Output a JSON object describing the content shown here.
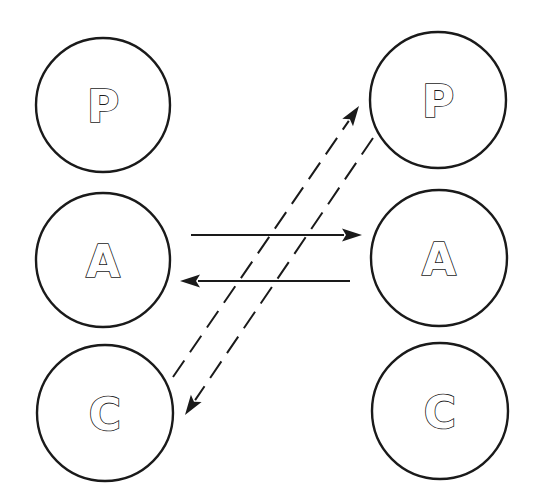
{
  "diagram": {
    "type": "transactional-analysis-ego-state-diagram",
    "colors": {
      "stroke": "#1a1a1a",
      "background": "#ffffff"
    },
    "left_person": {
      "nodes": [
        {
          "id": "L-P",
          "label": "P",
          "cx": 103,
          "cy": 105,
          "r": 67
        },
        {
          "id": "L-A",
          "label": "A",
          "cx": 103,
          "cy": 260,
          "r": 67
        },
        {
          "id": "L-C",
          "label": "C",
          "cx": 105,
          "cy": 413,
          "r": 68
        }
      ]
    },
    "right_person": {
      "nodes": [
        {
          "id": "R-P",
          "label": "P",
          "cx": 438,
          "cy": 100,
          "r": 68
        },
        {
          "id": "R-A",
          "label": "A",
          "cx": 439,
          "cy": 258,
          "r": 68
        },
        {
          "id": "R-C",
          "label": "C",
          "cx": 440,
          "cy": 411,
          "r": 68
        }
      ]
    },
    "arrows": [
      {
        "id": "adult-to-adult",
        "from": "L-A",
        "to": "R-A",
        "style": "solid",
        "x1": 191,
        "y1": 235,
        "x2": 362,
        "y2": 235
      },
      {
        "id": "adult-to-adult-return",
        "from": "R-A",
        "to": "L-A",
        "style": "solid",
        "x1": 350,
        "y1": 281,
        "x2": 180,
        "y2": 281
      },
      {
        "id": "child-to-parent",
        "from": "L-C",
        "to": "R-P",
        "style": "dashed",
        "x1": 173,
        "y1": 377,
        "x2": 359,
        "y2": 106
      },
      {
        "id": "parent-to-child",
        "from": "R-P",
        "to": "L-C",
        "style": "dashed",
        "x1": 373,
        "y1": 138,
        "x2": 185,
        "y2": 415
      }
    ]
  }
}
